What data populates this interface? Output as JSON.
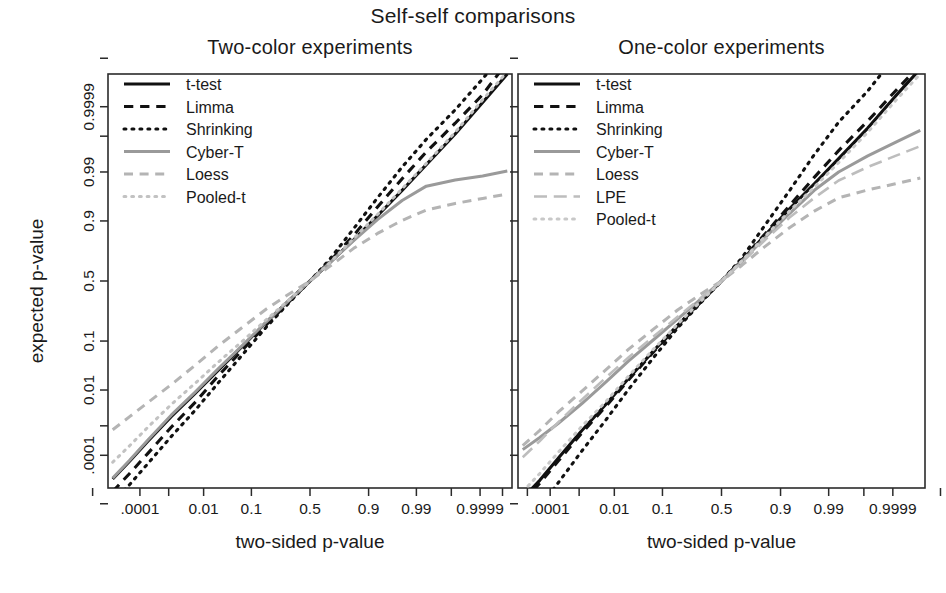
{
  "figure": {
    "title": "Self-self comparisons",
    "ylabel": "expected p-value",
    "width": 946,
    "height": 593
  },
  "panels": {
    "left": {
      "title": "Two-color experiments",
      "xlabel": "two-sided p-value"
    },
    "right": {
      "title": "One-color experiments",
      "xlabel": "two-sided p-value"
    }
  },
  "chart_data": {
    "type": "line",
    "title": "Self-self comparisons",
    "xlabel": "two-sided p-value",
    "ylabel": "expected p-value",
    "grid": false,
    "legend_position": "top-left",
    "axis_scale": "double-logit (normal-quantile) on both axes",
    "x_ticks": {
      "positions": [
        1e-06,
        0.0001,
        0.001,
        0.01,
        0.1,
        0.5,
        0.9,
        0.99,
        0.999,
        0.9999,
        0.999999
      ],
      "labels": [
        "",
        ".0001",
        "",
        "0.01",
        "0.1",
        "0.5",
        "0.9",
        "0.99",
        "",
        "0.9999",
        ""
      ]
    },
    "y_ticks": {
      "positions": [
        1e-06,
        0.0001,
        0.001,
        0.01,
        0.1,
        0.5,
        0.9,
        0.99,
        0.999,
        0.9999,
        0.999999
      ],
      "labels": [
        "",
        ".0001",
        "",
        "0.01",
        "0.1",
        "0.5",
        "0.9",
        "0.99",
        "",
        "0.9999",
        ""
      ]
    },
    "xlim": [
      5e-06,
      0.999995
    ],
    "ylim": [
      5e-06,
      0.999995
    ],
    "panels": [
      {
        "name": "Two-color experiments",
        "legend": [
          {
            "name": "t-test",
            "style": "solid",
            "color": "#111111",
            "width": 3.1
          },
          {
            "name": "Limma",
            "style": "dashed",
            "color": "#111111",
            "width": 3.1
          },
          {
            "name": "Shrinking",
            "style": "dotted",
            "color": "#111111",
            "width": 3.1
          },
          {
            "name": "Cyber-T",
            "style": "solid",
            "color": "#9a9a9a",
            "width": 3.0
          },
          {
            "name": "Loess",
            "style": "dashed",
            "color": "#b4b4b4",
            "width": 3.0
          },
          {
            "name": "Pooled-t",
            "style": "dotted",
            "color": "#c2c2c2",
            "width": 3.0
          }
        ],
        "series": [
          {
            "name": "t-test",
            "x": [
              8e-06,
              4e-05,
              0.0002,
              0.0012,
              0.006,
              0.022,
              0.07,
              0.17,
              0.33,
              0.5,
              0.67,
              0.83,
              0.93,
              0.978,
              0.9945,
              0.99925,
              0.99992,
              0.999992
            ],
            "y": [
              1.2e-05,
              6e-05,
              0.00032,
              0.0019,
              0.0082,
              0.028,
              0.082,
              0.19,
              0.345,
              0.5,
              0.655,
              0.81,
              0.918,
              0.9735,
              0.9935,
              0.99915,
              0.99993,
              0.999995
            ]
          },
          {
            "name": "Limma",
            "x": [
              8e-06,
              4e-05,
              0.0002,
              0.0012,
              0.006,
              0.022,
              0.07,
              0.17,
              0.33,
              0.5,
              0.67,
              0.83,
              0.93,
              0.978,
              0.9945,
              0.99925,
              0.99992,
              0.999992
            ],
            "y": [
              3.5e-06,
              2e-05,
              0.00012,
              0.0009,
              0.0048,
              0.021,
              0.071,
              0.175,
              0.335,
              0.5,
              0.665,
              0.835,
              0.943,
              0.9855,
              0.99705,
              0.99962,
              0.999965,
              0.9999985
            ]
          },
          {
            "name": "Shrinking",
            "x": [
              8e-06,
              4e-05,
              0.0002,
              0.0012,
              0.006,
              0.022,
              0.07,
              0.17,
              0.33,
              0.5,
              0.67,
              0.83,
              0.93,
              0.978,
              0.9945,
              0.99925,
              0.99992,
              0.999992
            ],
            "y": [
              1.2e-06,
              7e-06,
              5e-05,
              0.00045,
              0.0029,
              0.0145,
              0.058,
              0.163,
              0.328,
              0.5,
              0.682,
              0.868,
              0.962,
              0.9925,
              0.99875,
              0.99987,
              0.999992,
              0.9999996
            ]
          },
          {
            "name": "Cyber-T",
            "x": [
              8e-06,
              4e-05,
              0.0002,
              0.0012,
              0.006,
              0.022,
              0.07,
              0.17,
              0.33,
              0.5,
              0.67,
              0.83,
              0.93,
              0.978,
              0.9945,
              0.99925,
              0.99992,
              0.999992
            ],
            "y": [
              1.3e-05,
              6.5e-05,
              0.00035,
              0.0021,
              0.0089,
              0.03,
              0.085,
              0.192,
              0.345,
              0.5,
              0.655,
              0.805,
              0.905,
              0.957,
              0.9785,
              0.9845,
              0.9875,
              0.9905
            ]
          },
          {
            "name": "Loess",
            "x": [
              8e-06,
              4e-05,
              0.0002,
              0.0012,
              0.006,
              0.022,
              0.07,
              0.17,
              0.33,
              0.5,
              0.67,
              0.83,
              0.93,
              0.978,
              0.9945,
              0.99925,
              0.99992,
              0.999992
            ],
            "y": [
              0.00075,
              0.0019,
              0.0048,
              0.0135,
              0.036,
              0.082,
              0.162,
              0.275,
              0.395,
              0.5,
              0.625,
              0.757,
              0.845,
              0.902,
              0.935,
              0.951,
              0.961,
              0.968
            ]
          },
          {
            "name": "Pooled-t",
            "x": [
              8e-06,
              4e-05,
              0.0002,
              0.0012,
              0.006,
              0.022,
              0.07,
              0.17,
              0.33,
              0.5,
              0.67,
              0.83,
              0.93,
              0.978,
              0.9945,
              0.99925,
              0.99992,
              0.999992
            ],
            "y": [
              5.5e-05,
              0.00022,
              0.00092,
              0.0042,
              0.0145,
              0.041,
              0.1,
              0.205,
              0.35,
              0.5,
              0.655,
              0.818,
              0.922,
              0.9755,
              0.99395,
              0.99925,
              0.999945,
              0.999996
            ]
          }
        ]
      },
      {
        "name": "One-color experiments",
        "legend": [
          {
            "name": "t-test",
            "style": "solid",
            "color": "#111111",
            "width": 3.1
          },
          {
            "name": "Limma",
            "style": "dashed",
            "color": "#111111",
            "width": 3.1
          },
          {
            "name": "Shrinking",
            "style": "dotted",
            "color": "#111111",
            "width": 3.1
          },
          {
            "name": "Cyber-T",
            "style": "solid",
            "color": "#9a9a9a",
            "width": 3.0
          },
          {
            "name": "Loess",
            "style": "dashed",
            "color": "#b4b4b4",
            "width": 3.0
          },
          {
            "name": "LPE",
            "style": "longdash",
            "color": "#bdbdbd",
            "width": 2.6
          },
          {
            "name": "Pooled-t",
            "style": "dotted",
            "color": "#c8c8c8",
            "width": 3.0
          }
        ],
        "series": [
          {
            "name": "t-test",
            "x": [
              8e-06,
              4e-05,
              0.0002,
              0.0012,
              0.006,
              0.022,
              0.07,
              0.17,
              0.33,
              0.5,
              0.67,
              0.83,
              0.93,
              0.978,
              0.9945,
              0.99925,
              0.99992,
              0.999992
            ],
            "y": [
              1.8e-06,
              1.05e-05,
              8e-05,
              0.0007,
              0.0042,
              0.019,
              0.068,
              0.172,
              0.332,
              0.5,
              0.668,
              0.838,
              0.938,
              0.981,
              0.9955,
              0.99945,
              0.99996,
              0.999997
            ]
          },
          {
            "name": "Limma",
            "x": [
              8e-06,
              4e-05,
              0.0002,
              0.0012,
              0.006,
              0.022,
              0.07,
              0.17,
              0.33,
              0.5,
              0.67,
              0.83,
              0.93,
              0.978,
              0.9945,
              0.99925,
              0.99992,
              0.999992
            ],
            "y": [
              1.2e-06,
              8e-06,
              6.2e-05,
              0.00058,
              0.0037,
              0.0175,
              0.065,
              0.168,
              0.33,
              0.5,
              0.672,
              0.845,
              0.946,
              0.9865,
              0.9973,
              0.99968,
              0.999975,
              0.999998
            ]
          },
          {
            "name": "Shrinking",
            "x": [
              8e-06,
              4e-05,
              0.0002,
              0.0012,
              0.006,
              0.022,
              0.07,
              0.17,
              0.33,
              0.5,
              0.67,
              0.83,
              0.93,
              0.978,
              0.9945,
              0.99925,
              0.99992,
              0.999992
            ],
            "y": [
              8e-08,
              7e-07,
              8.5e-06,
              0.00014,
              0.0015,
              0.0105,
              0.051,
              0.157,
              0.325,
              0.5,
              0.688,
              0.886,
              0.973,
              0.9965,
              0.99965,
              0.999975,
              0.9999992,
              0.99999997
            ]
          },
          {
            "name": "Cyber-T",
            "x": [
              8e-06,
              4e-05,
              0.0002,
              0.0012,
              0.006,
              0.022,
              0.07,
              0.17,
              0.33,
              0.5,
              0.67,
              0.83,
              0.93,
              0.978,
              0.9945,
              0.99925,
              0.99992,
              0.999992
            ],
            "y": [
              0.00016,
              0.00042,
              0.0012,
              0.0044,
              0.0155,
              0.044,
              0.105,
              0.208,
              0.353,
              0.5,
              0.662,
              0.825,
              0.925,
              0.9735,
              0.99,
              0.9962,
              0.99845,
              0.99935
            ]
          },
          {
            "name": "Loess",
            "x": [
              8e-06,
              4e-05,
              0.0002,
              0.0012,
              0.006,
              0.022,
              0.07,
              0.17,
              0.33,
              0.5,
              0.67,
              0.83,
              0.93,
              0.978,
              0.9945,
              0.99925,
              0.99992,
              0.999992
            ],
            "y": [
              0.00022,
              0.00072,
              0.0026,
              0.0092,
              0.029,
              0.073,
              0.152,
              0.268,
              0.392,
              0.5,
              0.63,
              0.772,
              0.872,
              0.932,
              0.962,
              0.974,
              0.981,
              0.986
            ]
          },
          {
            "name": "LPE",
            "x": [
              8e-06,
              4e-05,
              0.0002,
              0.0012,
              0.006,
              0.022,
              0.07,
              0.17,
              0.33,
              0.5,
              0.67,
              0.83,
              0.93,
              0.978,
              0.9945,
              0.99925,
              0.99992,
              0.999992
            ],
            "y": [
              8.5e-05,
              0.00032,
              0.0013,
              0.0056,
              0.0195,
              0.052,
              0.118,
              0.222,
              0.362,
              0.5,
              0.652,
              0.812,
              0.912,
              0.962,
              0.984,
              0.9925,
              0.9962,
              0.998
            ]
          },
          {
            "name": "Pooled-t",
            "x": [
              8e-06,
              4e-05,
              0.0002,
              0.0012,
              0.006,
              0.022,
              0.07,
              0.17,
              0.33,
              0.5,
              0.67,
              0.83,
              0.93,
              0.978,
              0.9945,
              0.99925,
              0.99992,
              0.999992
            ],
            "y": [
              3.5e-06,
              2e-05,
              0.00013,
              0.00095,
              0.005,
              0.0215,
              0.073,
              0.178,
              0.336,
              0.5,
              0.666,
              0.832,
              0.932,
              0.9775,
              0.99425,
              0.99925,
              0.99994,
              0.999995
            ]
          }
        ]
      }
    ]
  }
}
